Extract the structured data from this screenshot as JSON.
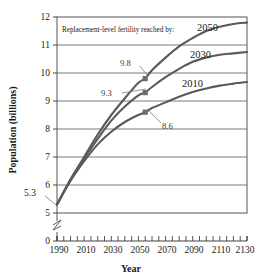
{
  "chart_data": {
    "type": "line",
    "title": "",
    "xlabel": "Year",
    "ylabel": "Population (billions)",
    "xlim": [
      1990,
      2130
    ],
    "ylim": [
      5,
      12
    ],
    "y_axis_break": true,
    "y_axis_zero_tick": "0",
    "grid": true,
    "grid_orientation": "horizontal",
    "x_ticks": [
      "1990",
      "2010",
      "2030",
      "2050",
      "2070",
      "2090",
      "2110",
      "2130"
    ],
    "x_tick_values": [
      1990,
      2010,
      2030,
      2050,
      2070,
      2090,
      2110,
      2130
    ],
    "x_minor_tick_step": 5,
    "y_ticks": [
      "0",
      "5",
      "6",
      "7",
      "8",
      "9",
      "10",
      "11",
      "12"
    ],
    "y_tick_values": [
      0,
      5,
      6,
      7,
      8,
      9,
      10,
      11,
      12
    ],
    "annotation": "Replacement-level fertility reached by:",
    "start_value_label": "5.3",
    "start_point": {
      "x": 1990,
      "y": 5.3
    },
    "series": [
      {
        "name": "2050",
        "label": "2050",
        "color": "#5a5a5a",
        "marker_label": "9.8",
        "marker_point": {
          "x": 2055,
          "y": 9.8
        },
        "x": [
          1990,
          2000,
          2010,
          2020,
          2030,
          2040,
          2050,
          2055,
          2060,
          2070,
          2080,
          2090,
          2100,
          2110,
          2120,
          2130
        ],
        "values": [
          5.3,
          6.2,
          7.0,
          7.8,
          8.5,
          9.1,
          9.65,
          9.8,
          10.1,
          10.55,
          10.95,
          11.25,
          11.5,
          11.65,
          11.75,
          11.8
        ]
      },
      {
        "name": "2030",
        "label": "2030",
        "color": "#5a5a5a",
        "marker_label": "9.3",
        "marker_point": {
          "x": 2055,
          "y": 9.3
        },
        "x": [
          1990,
          2000,
          2010,
          2020,
          2030,
          2040,
          2050,
          2055,
          2060,
          2070,
          2080,
          2090,
          2100,
          2110,
          2120,
          2130
        ],
        "values": [
          5.3,
          6.2,
          6.95,
          7.65,
          8.3,
          8.8,
          9.2,
          9.3,
          9.5,
          9.85,
          10.15,
          10.4,
          10.55,
          10.65,
          10.7,
          10.75
        ]
      },
      {
        "name": "2010",
        "label": "2010",
        "color": "#5a5a5a",
        "marker_label": "8.6",
        "marker_point": {
          "x": 2055,
          "y": 8.6
        },
        "x": [
          1990,
          2000,
          2010,
          2020,
          2030,
          2040,
          2050,
          2055,
          2060,
          2070,
          2080,
          2090,
          2100,
          2110,
          2120,
          2130
        ],
        "values": [
          5.3,
          6.15,
          6.85,
          7.45,
          7.9,
          8.25,
          8.5,
          8.6,
          8.75,
          8.95,
          9.15,
          9.32,
          9.45,
          9.55,
          9.62,
          9.68
        ]
      }
    ]
  },
  "labels": {
    "series_2050": "2050",
    "series_2030": "2030",
    "series_2010": "2010",
    "point_98": "9.8",
    "point_93": "9.3",
    "point_86": "8.6",
    "origin": "5.3",
    "annotation": "Replacement-level fertility reached by:",
    "y_axis_title": "Population (billions)",
    "x_axis_title": "Year",
    "ytick_0": "0",
    "ytick_5": "5",
    "ytick_6": "6",
    "ytick_7": "7",
    "ytick_8": "8",
    "ytick_9": "9",
    "ytick_10": "10",
    "ytick_11": "11",
    "ytick_12": "12",
    "xtick_1990": "1990",
    "xtick_2010": "2010",
    "xtick_2030": "2030",
    "xtick_2050": "2050",
    "xtick_2070": "2070",
    "xtick_2090": "2090",
    "xtick_2110": "2110",
    "xtick_2130": "2130"
  }
}
